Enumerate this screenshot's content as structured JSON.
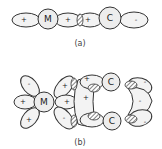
{
  "diagram": {
    "part_a": {
      "caption": "(a)",
      "atoms": [
        {
          "label": "M"
        },
        {
          "label": "C"
        }
      ],
      "lobe_signs": [
        "+",
        "+",
        "+",
        "-"
      ]
    },
    "part_b": {
      "caption": "(b)",
      "atoms": [
        {
          "label": "M"
        },
        {
          "label": "C"
        },
        {
          "label": "C"
        }
      ],
      "lobe_signs": {
        "m_upper_left": "-",
        "m_left": "+",
        "m_lower_left": "+",
        "m_upper_right": "+",
        "m_right": "+",
        "m_lower_right": "-",
        "center": "+",
        "c_upper_left": "+",
        "c_upper_right": "-",
        "right_bridge": "-",
        "c_lower_right": "-"
      }
    }
  }
}
